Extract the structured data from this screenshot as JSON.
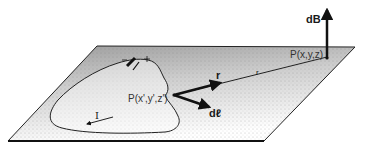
{
  "diagram": {
    "type": "biot-savart-geometry",
    "labels": {
      "field_element": "dB",
      "field_point": "P(x,y,z)",
      "source_point": "P(x',y',z')",
      "position_vector_unit": "r",
      "position_vector": "r",
      "current_element": "dℓ",
      "current": "I"
    },
    "colors": {
      "ink": "#111111",
      "plane_shade": "#c8c8c8",
      "background": "#ffffff"
    }
  }
}
